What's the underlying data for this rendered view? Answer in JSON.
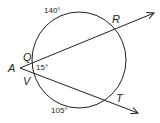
{
  "diagram": {
    "type": "circle-secants",
    "points": {
      "A": "A",
      "Q": "Q",
      "R": "R",
      "V": "V",
      "T": "T"
    },
    "arcs": {
      "far_arc_top": "140°",
      "far_arc_bottom": "105°"
    },
    "angle_at_A": "15°",
    "colors": {
      "stroke": "#231f20",
      "background": "#ffffff"
    }
  }
}
